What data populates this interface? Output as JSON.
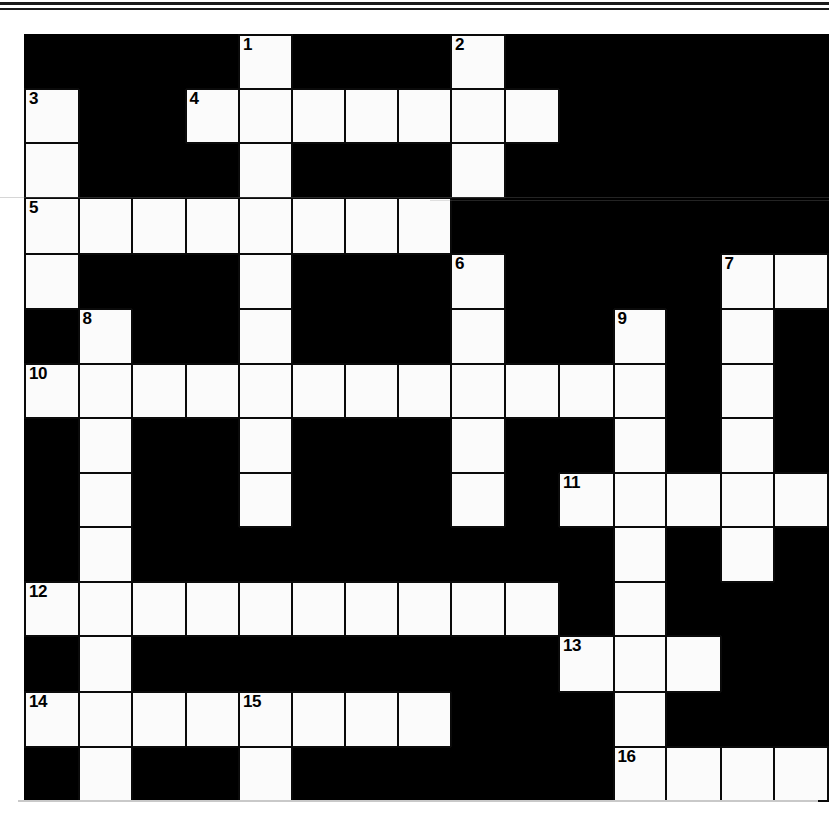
{
  "document": {
    "kind": "crossword-puzzle-grid",
    "title": "Crossword Puzzle",
    "grid_rows": 14,
    "grid_cols": 15,
    "colors": {
      "block": "#000000",
      "cell": "#fbfbfb",
      "cell_border": "#0a0a0a",
      "number_text": "#000000",
      "page_background": "#ffffff",
      "rule_line": "#1a1a1a"
    }
  },
  "grid": {
    "legend": {
      "block": "#",
      "open": "."
    },
    "rows": [
      "####.####.#####",
      "#.##.....#.####",
      "#.##.####.#####",
      "........###.###",
      "#.##.###.###..#",
      "##.#.###.##.#.#",
      "............#.#",
      "#.#.#.##.##.#.#",
      "#.#.#.##.##.....",
      "#.#.####.###.#.#",
      "...........##.#",
      "#.########...#.#",
      "......##.##.#.#",
      "#.#.#.####....."
    ],
    "cells": [
      [
        {
          "t": "block"
        },
        {
          "t": "block"
        },
        {
          "t": "block"
        },
        {
          "t": "block"
        },
        {
          "t": "open",
          "n": "1"
        },
        {
          "t": "block"
        },
        {
          "t": "block"
        },
        {
          "t": "block"
        },
        {
          "t": "open",
          "n": "2"
        },
        {
          "t": "block"
        },
        {
          "t": "block"
        },
        {
          "t": "block"
        },
        {
          "t": "block"
        },
        {
          "t": "block"
        },
        {
          "t": "block"
        }
      ],
      [
        {
          "t": "open",
          "n": "3"
        },
        {
          "t": "block"
        },
        {
          "t": "block"
        },
        {
          "t": "open",
          "n": "4"
        },
        {
          "t": "open"
        },
        {
          "t": "open"
        },
        {
          "t": "open"
        },
        {
          "t": "open"
        },
        {
          "t": "open"
        },
        {
          "t": "open"
        },
        {
          "t": "block"
        },
        {
          "t": "block"
        },
        {
          "t": "block"
        },
        {
          "t": "block"
        },
        {
          "t": "block"
        }
      ],
      [
        {
          "t": "open"
        },
        {
          "t": "block"
        },
        {
          "t": "block"
        },
        {
          "t": "block"
        },
        {
          "t": "open"
        },
        {
          "t": "block"
        },
        {
          "t": "block"
        },
        {
          "t": "block"
        },
        {
          "t": "open"
        },
        {
          "t": "block"
        },
        {
          "t": "block"
        },
        {
          "t": "block"
        },
        {
          "t": "block"
        },
        {
          "t": "block"
        },
        {
          "t": "block"
        }
      ],
      [
        {
          "t": "open",
          "n": "5"
        },
        {
          "t": "open"
        },
        {
          "t": "open"
        },
        {
          "t": "open"
        },
        {
          "t": "open"
        },
        {
          "t": "open"
        },
        {
          "t": "open"
        },
        {
          "t": "open"
        },
        {
          "t": "block"
        },
        {
          "t": "block"
        },
        {
          "t": "block"
        },
        {
          "t": "block"
        },
        {
          "t": "block"
        },
        {
          "t": "block"
        },
        {
          "t": "block"
        }
      ],
      [
        {
          "t": "open"
        },
        {
          "t": "block"
        },
        {
          "t": "block"
        },
        {
          "t": "block"
        },
        {
          "t": "open"
        },
        {
          "t": "block"
        },
        {
          "t": "block"
        },
        {
          "t": "block"
        },
        {
          "t": "open",
          "n": "6"
        },
        {
          "t": "block"
        },
        {
          "t": "block"
        },
        {
          "t": "block"
        },
        {
          "t": "block"
        },
        {
          "t": "open",
          "n": "7"
        },
        {
          "t": "open"
        }
      ],
      [
        {
          "t": "block"
        },
        {
          "t": "open",
          "n": "8"
        },
        {
          "t": "block"
        },
        {
          "t": "block"
        },
        {
          "t": "open"
        },
        {
          "t": "block"
        },
        {
          "t": "block"
        },
        {
          "t": "block"
        },
        {
          "t": "open"
        },
        {
          "t": "block"
        },
        {
          "t": "block"
        },
        {
          "t": "open",
          "n": "9"
        },
        {
          "t": "block"
        },
        {
          "t": "open"
        },
        {
          "t": "block"
        }
      ],
      [
        {
          "t": "open",
          "n": "10"
        },
        {
          "t": "open"
        },
        {
          "t": "open"
        },
        {
          "t": "open"
        },
        {
          "t": "open"
        },
        {
          "t": "open"
        },
        {
          "t": "open"
        },
        {
          "t": "open"
        },
        {
          "t": "open"
        },
        {
          "t": "open"
        },
        {
          "t": "open"
        },
        {
          "t": "open"
        },
        {
          "t": "block"
        },
        {
          "t": "open"
        },
        {
          "t": "block"
        }
      ],
      [
        {
          "t": "block"
        },
        {
          "t": "open"
        },
        {
          "t": "block"
        },
        {
          "t": "block"
        },
        {
          "t": "open"
        },
        {
          "t": "block"
        },
        {
          "t": "block"
        },
        {
          "t": "block"
        },
        {
          "t": "open"
        },
        {
          "t": "block"
        },
        {
          "t": "block"
        },
        {
          "t": "open"
        },
        {
          "t": "block"
        },
        {
          "t": "open"
        },
        {
          "t": "block"
        }
      ],
      [
        {
          "t": "block"
        },
        {
          "t": "open"
        },
        {
          "t": "block"
        },
        {
          "t": "block"
        },
        {
          "t": "open"
        },
        {
          "t": "block"
        },
        {
          "t": "block"
        },
        {
          "t": "block"
        },
        {
          "t": "open"
        },
        {
          "t": "block"
        },
        {
          "t": "open",
          "n": "11"
        },
        {
          "t": "open"
        },
        {
          "t": "open"
        },
        {
          "t": "open"
        },
        {
          "t": "open"
        }
      ],
      [
        {
          "t": "block"
        },
        {
          "t": "open"
        },
        {
          "t": "block"
        },
        {
          "t": "block"
        },
        {
          "t": "block"
        },
        {
          "t": "block"
        },
        {
          "t": "block"
        },
        {
          "t": "block"
        },
        {
          "t": "block"
        },
        {
          "t": "block"
        },
        {
          "t": "block"
        },
        {
          "t": "open"
        },
        {
          "t": "block"
        },
        {
          "t": "open"
        },
        {
          "t": "block"
        }
      ],
      [
        {
          "t": "open",
          "n": "12"
        },
        {
          "t": "open"
        },
        {
          "t": "open"
        },
        {
          "t": "open"
        },
        {
          "t": "open"
        },
        {
          "t": "open"
        },
        {
          "t": "open"
        },
        {
          "t": "open"
        },
        {
          "t": "open"
        },
        {
          "t": "open"
        },
        {
          "t": "block"
        },
        {
          "t": "open"
        },
        {
          "t": "block"
        },
        {
          "t": "block"
        },
        {
          "t": "block"
        }
      ],
      [
        {
          "t": "block"
        },
        {
          "t": "open"
        },
        {
          "t": "block"
        },
        {
          "t": "block"
        },
        {
          "t": "block"
        },
        {
          "t": "block"
        },
        {
          "t": "block"
        },
        {
          "t": "block"
        },
        {
          "t": "block"
        },
        {
          "t": "block"
        },
        {
          "t": "open",
          "n": "13"
        },
        {
          "t": "open"
        },
        {
          "t": "open"
        },
        {
          "t": "block"
        },
        {
          "t": "block"
        }
      ],
      [
        {
          "t": "open",
          "n": "14"
        },
        {
          "t": "open"
        },
        {
          "t": "open"
        },
        {
          "t": "open"
        },
        {
          "t": "open",
          "n": "15"
        },
        {
          "t": "open"
        },
        {
          "t": "open"
        },
        {
          "t": "open"
        },
        {
          "t": "block"
        },
        {
          "t": "block"
        },
        {
          "t": "block"
        },
        {
          "t": "open"
        },
        {
          "t": "block"
        },
        {
          "t": "block"
        },
        {
          "t": "block"
        }
      ],
      [
        {
          "t": "block"
        },
        {
          "t": "open"
        },
        {
          "t": "block"
        },
        {
          "t": "block"
        },
        {
          "t": "open"
        },
        {
          "t": "block"
        },
        {
          "t": "block"
        },
        {
          "t": "block"
        },
        {
          "t": "block"
        },
        {
          "t": "block"
        },
        {
          "t": "block"
        },
        {
          "t": "open",
          "n": "16"
        },
        {
          "t": "open"
        },
        {
          "t": "open"
        },
        {
          "t": "open"
        }
      ]
    ]
  },
  "clue_numbers": [
    "1",
    "2",
    "3",
    "4",
    "5",
    "6",
    "7",
    "8",
    "9",
    "10",
    "11",
    "12",
    "13",
    "14",
    "15",
    "16"
  ],
  "entries": {
    "across": [
      {
        "number": "4",
        "row": 1,
        "col": 3,
        "length": 7
      },
      {
        "number": "5",
        "row": 3,
        "col": 0,
        "length": 8
      },
      {
        "number": "7",
        "row": 4,
        "col": 13,
        "length": 2
      },
      {
        "number": "10",
        "row": 6,
        "col": 0,
        "length": 12
      },
      {
        "number": "11",
        "row": 8,
        "col": 10,
        "length": 5
      },
      {
        "number": "12",
        "row": 10,
        "col": 0,
        "length": 10
      },
      {
        "number": "13",
        "row": 11,
        "col": 10,
        "length": 3
      },
      {
        "number": "14",
        "row": 12,
        "col": 0,
        "length": 8
      },
      {
        "number": "16",
        "row": 13,
        "col": 11,
        "length": 4
      }
    ],
    "down": [
      {
        "number": "1",
        "row": 0,
        "col": 4,
        "length": 9
      },
      {
        "number": "2",
        "row": 0,
        "col": 8,
        "length": 3
      },
      {
        "number": "3",
        "row": 1,
        "col": 0,
        "length": 4
      },
      {
        "number": "6",
        "row": 4,
        "col": 8,
        "length": 5
      },
      {
        "number": "7",
        "row": 4,
        "col": 13,
        "length": 7
      },
      {
        "number": "8",
        "row": 5,
        "col": 1,
        "length": 9
      },
      {
        "number": "9",
        "row": 5,
        "col": 11,
        "length": 9
      },
      {
        "number": "15",
        "row": 12,
        "col": 4,
        "length": 2
      }
    ]
  }
}
